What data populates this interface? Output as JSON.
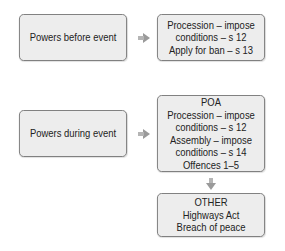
{
  "flow_before": {
    "source": {
      "lines": [
        "Powers before event"
      ]
    },
    "target": {
      "lines": [
        "Procession  – impose",
        "conditions – s 12",
        "Apply for ban – s 13"
      ]
    }
  },
  "flow_during": {
    "source": {
      "lines": [
        "Powers during event"
      ]
    },
    "target": {
      "lines": [
        "POA",
        "Procession – impose",
        "conditions – s 12",
        "Assembly – impose",
        "conditions – s 14",
        "Offences 1–5"
      ]
    },
    "other": {
      "lines": [
        "OTHER",
        "Highways Act",
        "Breach of peace"
      ]
    }
  },
  "colors": {
    "box_fill": "#ededed",
    "box_border": "#7a7a7a",
    "arrow": "#9a9a9a"
  }
}
